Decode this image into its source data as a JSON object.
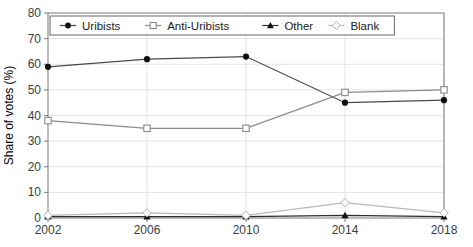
{
  "chart_data": {
    "type": "line",
    "title": "",
    "xlabel": "",
    "ylabel": "Share of votes (%)",
    "x": [
      2002,
      2006,
      2010,
      2014,
      2018
    ],
    "ylim": [
      0,
      80
    ],
    "ytick_step": 10,
    "yticks": [
      0,
      10,
      20,
      30,
      40,
      50,
      60,
      70,
      80
    ],
    "grid": true,
    "legend_position": "top-left-inside",
    "series": [
      {
        "name": "Uribists",
        "marker": "circle-filled",
        "line_color": "#4a4a4a",
        "marker_color": "#111111",
        "values": [
          59,
          62,
          63,
          45,
          46
        ]
      },
      {
        "name": "Anti-Uribists",
        "marker": "square-open",
        "line_color": "#8a8a8a",
        "marker_color": "#8a8a8a",
        "values": [
          38,
          35,
          35,
          49,
          50
        ]
      },
      {
        "name": "Other",
        "marker": "triangle-filled",
        "line_color": "#2e2e2e",
        "marker_color": "#111111",
        "values": [
          0.5,
          0.5,
          0.5,
          1,
          0.5
        ]
      },
      {
        "name": "Blank",
        "marker": "diamond-open",
        "line_color": "#b8b8b8",
        "marker_color": "#b0b0b0",
        "values": [
          1,
          2,
          1,
          6,
          2
        ]
      }
    ],
    "colors": {
      "plot_border": "#7a7a7a",
      "grid_line": "#e4e4e4",
      "tick_text": "#3c3c3c",
      "background": "#ffffff",
      "legend_border": "#666666"
    }
  }
}
